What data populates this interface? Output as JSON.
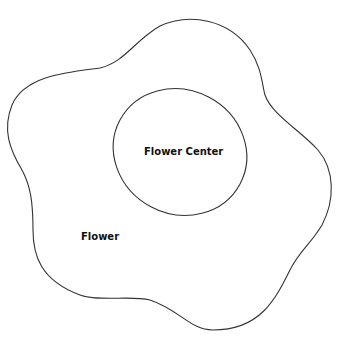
{
  "diagram": {
    "labels": {
      "center": "Flower Center",
      "outer": "Flower"
    },
    "colors": {
      "stroke": "#333333",
      "text": "#111111",
      "background": "#ffffff"
    }
  }
}
